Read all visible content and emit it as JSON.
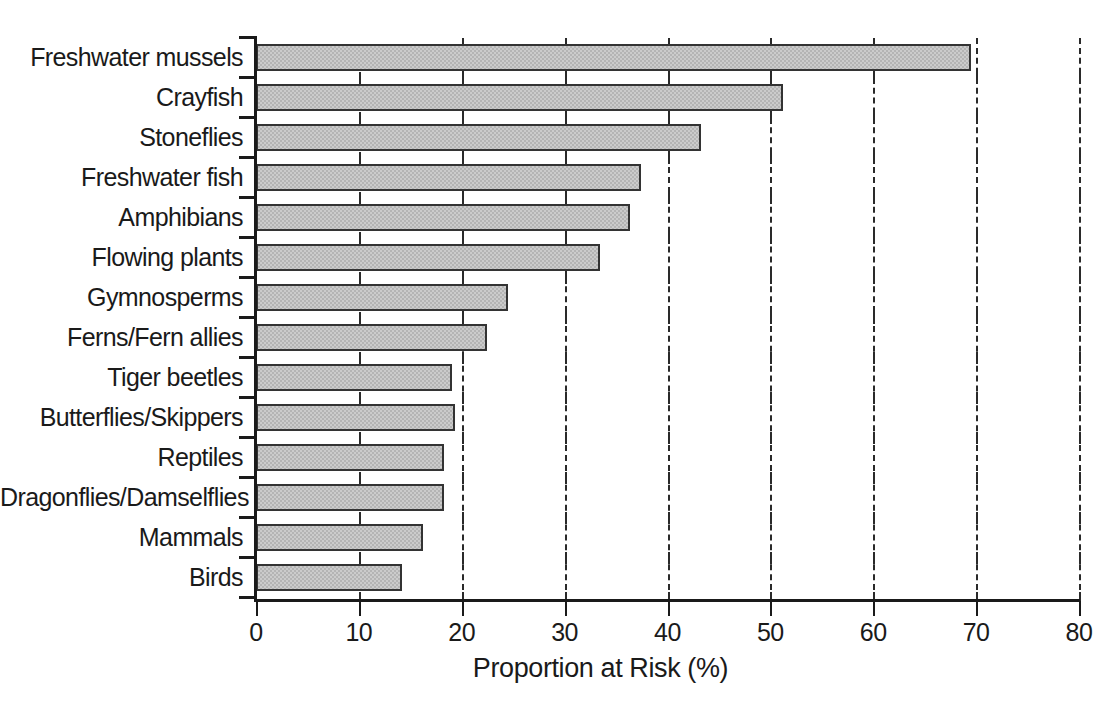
{
  "chart_data": {
    "type": "bar",
    "orientation": "horizontal",
    "title": "",
    "xlabel": "Proportion at Risk (%)",
    "ylabel": "",
    "xlim": [
      0,
      80
    ],
    "xticks": [
      0,
      10,
      20,
      30,
      40,
      50,
      60,
      70,
      80
    ],
    "xticklabels": [
      "0",
      "10",
      "20",
      "30",
      "40",
      "50",
      "60",
      "70",
      "80"
    ],
    "gridlines_x": [
      20,
      30,
      40,
      50,
      60,
      70,
      80
    ],
    "grid": "dashed vertical gridlines at 20,30,40,50,60,70,80",
    "legend": null,
    "categories": [
      "Freshwater mussels",
      "Crayfish",
      "Stoneflies",
      "Freshwater fish",
      "Amphibians",
      "Flowing plants",
      "Gymnosperms",
      "Ferns/Fern allies",
      "Tiger beetles",
      "Butterflies/Skippers",
      "Reptiles",
      "Dragonflies/Damselflies",
      "Mammals",
      "Birds"
    ],
    "values": [
      69.5,
      51.2,
      43.3,
      37.4,
      36.4,
      33.4,
      24.5,
      22.5,
      19.1,
      19.3,
      18.3,
      18.3,
      16.2,
      14.2
    ],
    "bar_color": "#b4b4b4",
    "bar_edge_color": "#333333"
  }
}
